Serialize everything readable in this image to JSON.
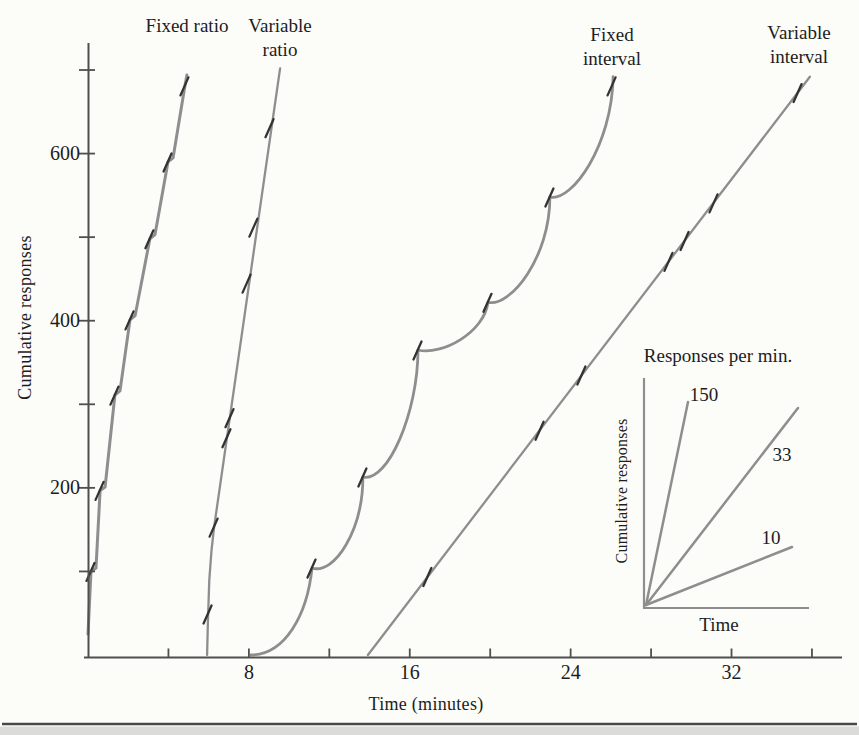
{
  "figure": {
    "background": "#fcfcf9",
    "curve_color": "#8e8e8e",
    "axis_color": "#4f4f4f",
    "pip_color": "#333333",
    "text_color": "#1d1d1d",
    "y_axis_label": "Cumulative responses",
    "x_axis_label": "Time (minutes)"
  },
  "chart_data": {
    "type": "line",
    "xlabel": "Time (minutes)",
    "ylabel": "Cumulative responses",
    "xlim": [
      0,
      37.5
    ],
    "ylim": [
      0,
      732
    ],
    "grid": false,
    "x_ticks": {
      "minor": [
        4,
        8,
        12,
        16,
        20,
        24,
        28,
        32,
        36
      ],
      "labeled": [
        8,
        16,
        24,
        32
      ]
    },
    "y_ticks": {
      "minor": [
        100,
        200,
        300,
        400,
        500,
        600,
        700
      ],
      "labeled": [
        200,
        400,
        600
      ]
    },
    "series": [
      {
        "name": "fixed-ratio",
        "label": "Fixed ratio",
        "label_x_px": 187,
        "label_y_px": 14,
        "stroke_width": 3,
        "points": [
          [
            0,
            25
          ],
          [
            0.15,
            100
          ],
          [
            0.4,
            104
          ],
          [
            0.6,
            197
          ],
          [
            0.85,
            201
          ],
          [
            1.34,
            311
          ],
          [
            1.59,
            316
          ],
          [
            2.09,
            401
          ],
          [
            2.34,
            406
          ],
          [
            3.08,
            498
          ],
          [
            3.33,
            503
          ],
          [
            3.98,
            590
          ],
          [
            4.23,
            595
          ],
          [
            4.82,
            681
          ],
          [
            4.92,
            694
          ]
        ],
        "pips": [
          [
            0.15,
            100
          ],
          [
            0.6,
            197
          ],
          [
            1.34,
            311
          ],
          [
            2.09,
            401
          ],
          [
            3.08,
            498
          ],
          [
            3.98,
            590
          ],
          [
            4.82,
            681
          ]
        ]
      },
      {
        "name": "variable-ratio",
        "label": "Variable ratio",
        "label_x_px": 280,
        "label_y_px": 14,
        "stroke_width": 2.3,
        "points": [
          [
            5.92,
            0
          ],
          [
            5.96,
            40
          ],
          [
            6.03,
            90
          ],
          [
            6.14,
            125
          ],
          [
            6.27,
            153
          ],
          [
            9.55,
            702
          ]
        ],
        "pips": [
          [
            5.97,
            49
          ],
          [
            6.27,
            153
          ],
          [
            6.91,
            260
          ],
          [
            7.06,
            284
          ],
          [
            7.91,
            445
          ],
          [
            8.25,
            512
          ],
          [
            9.05,
            631
          ]
        ]
      },
      {
        "name": "fixed-interval",
        "label": "Fixed interval",
        "label_x_px": 612,
        "label_y_px": 23,
        "stroke_width": 2.8,
        "bezier": {
          "start": [
            8.1,
            0
          ],
          "segments": [
            {
              "c1": [
                9.8,
                0.6
              ],
              "c2": [
                10.9,
                48
              ],
              "p": [
                11.14,
                104
              ]
            },
            {
              "c1": [
                12.28,
                96
              ],
              "c2": [
                13.67,
                150
              ],
              "p": [
                13.67,
                213
              ]
            },
            {
              "c1": [
                14.92,
                206
              ],
              "c2": [
                16.41,
                291
              ],
              "p": [
                16.41,
                365
              ]
            },
            {
              "c1": [
                17.6,
                358
              ],
              "c2": [
                19.7,
                386
              ],
              "p": [
                19.89,
                422
              ]
            },
            {
              "c1": [
                20.99,
                416
              ],
              "c2": [
                22.97,
                475
              ],
              "p": [
                22.97,
                548
              ]
            },
            {
              "c1": [
                24.07,
                542
              ],
              "c2": [
                26.06,
                610
              ],
              "p": [
                26.11,
                692
              ]
            }
          ]
        },
        "pips": [
          [
            11.14,
            104
          ],
          [
            13.67,
            213
          ],
          [
            16.41,
            365
          ],
          [
            19.89,
            422
          ],
          [
            22.97,
            548
          ],
          [
            26.06,
            681
          ]
        ]
      },
      {
        "name": "variable-interval",
        "label": "Variable interval",
        "label_x_px": 799,
        "label_y_px": 21,
        "stroke_width": 2.3,
        "points": [
          [
            13.92,
            0
          ],
          [
            35.9,
            692
          ]
        ],
        "pips": [
          [
            16.9,
            94
          ],
          [
            22.48,
            269
          ],
          [
            24.56,
            335
          ],
          [
            28.89,
            471
          ],
          [
            29.69,
            496
          ],
          [
            31.13,
            541
          ],
          [
            35.31,
            673
          ]
        ]
      }
    ],
    "inset": {
      "title": "Responses per min.",
      "ylabel": "Cumulative responses",
      "xlabel": "Time",
      "lines": [
        {
          "label": "150",
          "slope_responses_per_min": 150,
          "end": [
            42,
            203
          ],
          "label_at": [
            58,
            209
          ]
        },
        {
          "label": "33",
          "slope_responses_per_min": 33,
          "end": [
            152,
            197
          ],
          "label_at": [
            136,
            149
          ]
        },
        {
          "label": "10",
          "slope_responses_per_min": 10,
          "end": [
            146,
            58
          ],
          "label_at": [
            125,
            66
          ]
        }
      ]
    }
  }
}
